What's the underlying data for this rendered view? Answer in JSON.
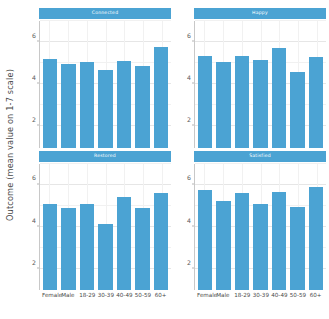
{
  "chart_data": {
    "type": "bar",
    "title": "",
    "subtitle": "",
    "xlabel": "",
    "ylabel": "Outcome (mean value on 1-7 scale)",
    "ylim": [
      1,
      7
    ],
    "yticks": [
      2,
      4,
      6
    ],
    "ytick_labels": [
      "2",
      "4",
      "6"
    ],
    "grid": true,
    "legend": "none",
    "bar_color": "#4ba3d3",
    "strip_color": "#4ba3d3",
    "strip_text_color": "#ffffff",
    "panel_background": "#ffffff",
    "gridline_color": "#e6e6e6",
    "axis_text_color": "#4a4a4a",
    "facet_layout": "2x2",
    "categories": [
      "Female",
      "Male",
      "18-29",
      "30-39",
      "40-49",
      "50-59",
      "60+"
    ],
    "facets": [
      {
        "name": "Connected",
        "values": [
          5.2,
          4.95,
          5.05,
          4.7,
          5.1,
          4.85,
          5.75
        ]
      },
      {
        "name": "Happy",
        "values": [
          5.35,
          5.05,
          5.35,
          5.15,
          5.7,
          4.6,
          5.3
        ]
      },
      {
        "name": "Restored",
        "values": [
          5.1,
          4.9,
          5.1,
          4.15,
          5.4,
          4.9,
          5.6
        ]
      },
      {
        "name": "Satisfied",
        "values": [
          5.75,
          5.2,
          5.6,
          5.1,
          5.65,
          4.95,
          5.9
        ]
      }
    ]
  },
  "axis": {
    "y_title": "Outcome (mean value on 1-7 scale)"
  }
}
